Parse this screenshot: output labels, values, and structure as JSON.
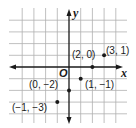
{
  "diagram": {
    "type": "coordinate-plane",
    "axes": {
      "x_label": "x",
      "y_label": "y",
      "origin_label": "O"
    },
    "grid": {
      "x_range": [
        -4,
        4
      ],
      "y_range": [
        -4,
        4
      ]
    },
    "points": [
      {
        "x": 2,
        "y": 0,
        "label": "(2, 0)"
      },
      {
        "x": 3,
        "y": 1,
        "label": "(3, 1)"
      },
      {
        "x": 1,
        "y": -1,
        "label": "(1, −1)"
      },
      {
        "x": 0,
        "y": -2,
        "label": "(0, −2)"
      },
      {
        "x": -1,
        "y": -3,
        "label": "(−1, −3)"
      }
    ],
    "colors": {
      "grid": "#b0b0b0",
      "axis": "#1a1a1a",
      "point": "#1a1a1a",
      "background": "#ffffff"
    }
  }
}
